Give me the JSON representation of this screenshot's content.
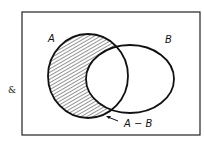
{
  "diagram": {
    "type": "venn",
    "universe_symbol": "&",
    "sets": [
      {
        "name": "A",
        "label": "A"
      },
      {
        "name": "B",
        "label": "B"
      }
    ],
    "shaded_region": "A - B",
    "annotation": {
      "label": "A − B"
    },
    "colors": {
      "stroke": "#111111",
      "background": "#ffffff"
    }
  }
}
